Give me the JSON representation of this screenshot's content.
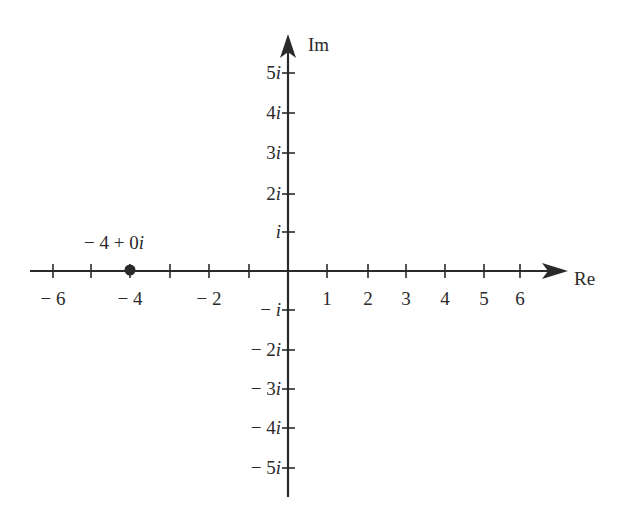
{
  "diagram": {
    "type": "complex-plane",
    "axes": {
      "real_label": "Re",
      "imag_label": "Im",
      "real_ticks": [
        -6,
        -5,
        -4,
        -3,
        -2,
        -1,
        1,
        2,
        3,
        4,
        5,
        6
      ],
      "real_tick_labels": [
        {
          "value": -6,
          "text": "− 6"
        },
        {
          "value": -4,
          "text": "− 4"
        },
        {
          "value": -2,
          "text": "− 2"
        },
        {
          "value": 1,
          "text": "1"
        },
        {
          "value": 2,
          "text": "2"
        },
        {
          "value": 3,
          "text": "3"
        },
        {
          "value": 4,
          "text": "4"
        },
        {
          "value": 5,
          "text": "5"
        },
        {
          "value": 6,
          "text": "6"
        }
      ],
      "imag_tick_labels": [
        {
          "value": 5,
          "coef": "5",
          "text": "5i"
        },
        {
          "value": 4,
          "coef": "4",
          "text": "4i"
        },
        {
          "value": 3,
          "coef": "3",
          "text": "3i"
        },
        {
          "value": 2,
          "coef": "2",
          "text": "2i"
        },
        {
          "value": 1,
          "coef": "",
          "text": "i"
        },
        {
          "value": -1,
          "coef": "− ",
          "text": "− i"
        },
        {
          "value": -2,
          "coef": "− 2",
          "text": "− 2i"
        },
        {
          "value": -3,
          "coef": "− 3",
          "text": "− 3i"
        },
        {
          "value": -4,
          "coef": "− 4",
          "text": "− 4i"
        },
        {
          "value": -5,
          "coef": "− 5",
          "text": "− 5i"
        }
      ]
    },
    "points": [
      {
        "re": -4,
        "im": 0,
        "label_prefix": "− 4 + 0",
        "label_suffix": "i",
        "label": "−4 + 0i"
      }
    ],
    "colors": {
      "ink": "#2a2a2a",
      "background": "#ffffff"
    }
  }
}
